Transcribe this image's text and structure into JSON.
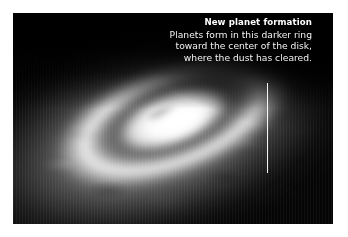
{
  "page": {
    "background_color": "#ffffff"
  },
  "figure": {
    "name": "protoplanetary-disk-illustration",
    "background_color": "#050505",
    "parts": {
      "outer_dust_envelope": "diffuse dust halo",
      "bright_outer_ring": "bright dust ring",
      "dark_gap_ring": "darker ring where planets form",
      "inner_bright_ring": "bright inner annulus",
      "central_star": "central star glow",
      "cleared_region": "dark cleared ellipse"
    }
  },
  "callout": {
    "title": "New planet formation",
    "lines": [
      "Planets form in this darker ring",
      "toward the center of the disk,",
      "where the dust has cleared."
    ],
    "text_color": "#ffffff",
    "leader_line_color": "#ffffff"
  }
}
